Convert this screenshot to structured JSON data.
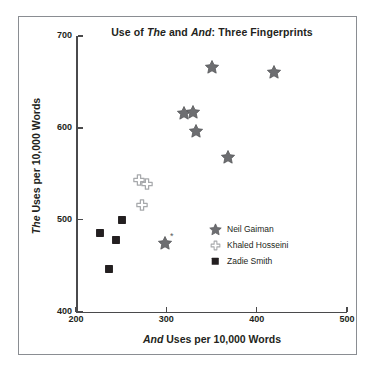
{
  "chart_data": {
    "type": "scatter",
    "title": "Use of The and And: Three Fingerprints",
    "title_parts": [
      {
        "text": "Use of ",
        "italic": false
      },
      {
        "text": "The",
        "italic": true
      },
      {
        "text": " and ",
        "italic": false
      },
      {
        "text": "And",
        "italic": true
      },
      {
        "text": ": Three Fingerprints",
        "italic": false
      }
    ],
    "xlabel": "And Uses per 10,000 Words",
    "xlabel_parts": [
      {
        "text": "And",
        "italic": true
      },
      {
        "text": " Uses per 10,000 Words",
        "italic": false
      }
    ],
    "ylabel": "The Uses per 10,000 Words",
    "ylabel_parts": [
      {
        "text": "The",
        "italic": true
      },
      {
        "text": " Uses per 10,000 Words",
        "italic": false
      }
    ],
    "xlim": [
      200,
      500
    ],
    "ylim": [
      400,
      700
    ],
    "xticks": [
      200,
      300,
      400,
      500
    ],
    "yticks": [
      400,
      500,
      600,
      700
    ],
    "xtick_labels": [
      "200",
      "300",
      "400",
      "500"
    ],
    "ytick_labels": [
      "400",
      "500",
      "600",
      "700"
    ],
    "grid": false,
    "legend_position": "center-right-inside",
    "annotations": [
      {
        "text": "*",
        "x": 306,
        "y": 482,
        "note": "small asterisk beside lone Neil Gaiman point"
      }
    ],
    "series": [
      {
        "name": "Neil Gaiman",
        "marker": "star",
        "color": "#6d6e71",
        "points": [
          {
            "x": 351,
            "y": 666
          },
          {
            "x": 419,
            "y": 661
          },
          {
            "x": 320,
            "y": 616
          },
          {
            "x": 329,
            "y": 617
          },
          {
            "x": 333,
            "y": 597
          },
          {
            "x": 368,
            "y": 568
          },
          {
            "x": 298,
            "y": 475
          }
        ]
      },
      {
        "name": "Khaled Hosseini",
        "marker": "cross-outline",
        "color": "#a7a9ac",
        "points": [
          {
            "x": 270,
            "y": 543
          },
          {
            "x": 279,
            "y": 539
          },
          {
            "x": 273,
            "y": 516
          }
        ]
      },
      {
        "name": "Zadie Smith",
        "marker": "square-filled",
        "color": "#231f20",
        "points": [
          {
            "x": 251,
            "y": 500
          },
          {
            "x": 227,
            "y": 485
          },
          {
            "x": 244,
            "y": 478
          },
          {
            "x": 236,
            "y": 446
          }
        ]
      }
    ]
  },
  "legend": {
    "entries": [
      {
        "label": "Neil Gaiman",
        "marker": "star"
      },
      {
        "label": "Khaled Hosseini",
        "marker": "cross-outline"
      },
      {
        "label": "Zadie Smith",
        "marker": "square-filled"
      }
    ]
  },
  "colors": {
    "axis": "#4a4a4c",
    "frame": "#8a8d92",
    "text": "#231f20",
    "star": "#6d6e71",
    "cross": "#a7a9ac",
    "square": "#231f20",
    "background": "#ffffff"
  }
}
